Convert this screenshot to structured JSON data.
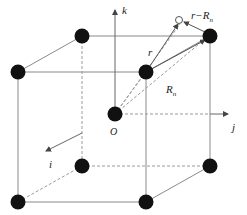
{
  "diagram": {
    "type": "cubic lattice with position vectors",
    "axes": {
      "k": "k",
      "j": "j",
      "i": "i",
      "origin": "O"
    },
    "vectors": {
      "r": "r",
      "Rn": "R",
      "Rn_sub": "n",
      "r_minus_Rn": "r−R",
      "r_minus_Rn_sub": "n"
    },
    "colors": {
      "atom": "#111111",
      "edge": "#888888",
      "dashed": "#999999",
      "arrow": "#555555"
    }
  }
}
